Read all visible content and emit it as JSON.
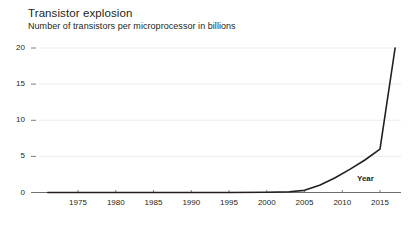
{
  "chart_data": {
    "type": "line",
    "title": "Transistor explosion",
    "subtitle": "Number of transistors per microprocessor in billions",
    "xlabel": "Year",
    "ylabel": "",
    "xlim": [
      1971,
      2018
    ],
    "ylim": [
      0,
      21
    ],
    "grid": true,
    "legend": null,
    "y_ticks": [
      "0",
      "5",
      "10",
      "15",
      "20"
    ],
    "y_tick_values": [
      0,
      5,
      10,
      15,
      20
    ],
    "x_ticks": [
      "1975",
      "1980",
      "1985",
      "1990",
      "1995",
      "2000",
      "2005",
      "2010",
      "2015"
    ],
    "x_tick_values": [
      1975,
      1980,
      1985,
      1990,
      1995,
      2000,
      2005,
      2010,
      2015
    ],
    "series": [
      {
        "name": "Transistors per microprocessor (billions)",
        "color": "#231f20",
        "x": [
          1971,
          1975,
          1980,
          1985,
          1990,
          1995,
          2000,
          2003,
          2005,
          2007,
          2009,
          2011,
          2013,
          2015,
          2017
        ],
        "values": [
          0.0,
          0.0,
          0.0,
          0.0,
          0.0,
          0.01,
          0.04,
          0.1,
          0.3,
          1.0,
          2.0,
          3.2,
          4.5,
          6.0,
          20.0
        ]
      }
    ]
  }
}
